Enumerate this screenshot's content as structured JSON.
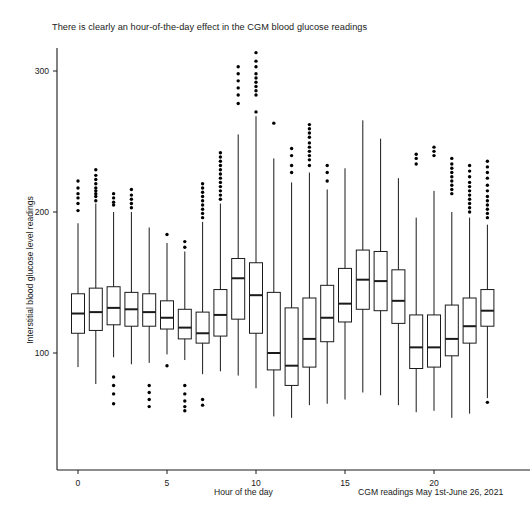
{
  "chart_data": {
    "type": "boxplot",
    "title": "There is clearly an hour-of-the-day effect in the CGM blood glucose readings",
    "xlabel": "Hour of the day",
    "ylabel": "Interstitial blood glucose level readings",
    "caption": "CGM readings May 1st-June 26, 2021",
    "grid": false,
    "legend": null,
    "xlim": [
      -0.8,
      23.8
    ],
    "ylim": [
      40,
      325
    ],
    "xticks": [
      0,
      5,
      10,
      15,
      20
    ],
    "yticks": [
      100,
      200,
      300
    ],
    "categories": [
      0,
      1,
      2,
      3,
      4,
      5,
      6,
      7,
      8,
      9,
      10,
      11,
      12,
      13,
      14,
      15,
      16,
      17,
      18,
      19,
      20,
      21,
      22,
      23
    ],
    "boxes": [
      {
        "hour": 0,
        "whisker_low": 90,
        "q1": 114,
        "median": 128,
        "q3": 142,
        "whisker_high": 192,
        "outliers": [
          201,
          206,
          210,
          213,
          217,
          222
        ]
      },
      {
        "hour": 1,
        "whisker_low": 78,
        "q1": 116,
        "median": 129,
        "q3": 146,
        "whisker_high": 206,
        "outliers": [
          208,
          211,
          213,
          215,
          217,
          220,
          223,
          226,
          230
        ]
      },
      {
        "hour": 2,
        "whisker_low": 97,
        "q1": 120,
        "median": 132,
        "q3": 147,
        "whisker_high": 200,
        "outliers": [
          205,
          207,
          210,
          213,
          83,
          77,
          71,
          64
        ]
      },
      {
        "hour": 3,
        "whisker_low": 92,
        "q1": 119,
        "median": 131,
        "q3": 143,
        "whisker_high": 200,
        "outliers": [
          203,
          206,
          209,
          212,
          216
        ]
      },
      {
        "hour": 4,
        "whisker_low": 93,
        "q1": 119,
        "median": 129,
        "q3": 142,
        "whisker_high": 189,
        "outliers": [
          77,
          72,
          67,
          62
        ]
      },
      {
        "hour": 5,
        "whisker_low": 99,
        "q1": 117,
        "median": 125,
        "q3": 137,
        "whisker_high": 178,
        "outliers": [
          184,
          91
        ]
      },
      {
        "hour": 6,
        "whisker_low": 95,
        "q1": 110,
        "median": 118,
        "q3": 131,
        "whisker_high": 172,
        "outliers": [
          175,
          179,
          77,
          71,
          66,
          62,
          59
        ]
      },
      {
        "hour": 7,
        "whisker_low": 85,
        "q1": 107,
        "median": 114,
        "q3": 129,
        "whisker_high": 193,
        "outliers": [
          196,
          199,
          202,
          205,
          208,
          211,
          214,
          217,
          220,
          67,
          63
        ]
      },
      {
        "hour": 8,
        "whisker_low": 87,
        "q1": 112,
        "median": 127,
        "q3": 145,
        "whisker_high": 206,
        "outliers": [
          209,
          212,
          215,
          218,
          221,
          224,
          227,
          230,
          233,
          236,
          239,
          242
        ]
      },
      {
        "hour": 9,
        "whisker_low": 84,
        "q1": 124,
        "median": 153,
        "q3": 167,
        "whisker_high": 255,
        "outliers": [
          277,
          283,
          288,
          293,
          298,
          303
        ]
      },
      {
        "hour": 10,
        "whisker_low": 75,
        "q1": 114,
        "median": 141,
        "q3": 164,
        "whisker_high": 268,
        "outliers": [
          271,
          283,
          286,
          289,
          292,
          295,
          298,
          303,
          307,
          313
        ]
      },
      {
        "hour": 11,
        "whisker_low": 55,
        "q1": 88,
        "median": 100,
        "q3": 143,
        "whisker_high": 238,
        "outliers": [
          263
        ]
      },
      {
        "hour": 12,
        "whisker_low": 54,
        "q1": 77,
        "median": 91,
        "q3": 132,
        "whisker_high": 221,
        "outliers": [
          228,
          233,
          240,
          245
        ]
      },
      {
        "hour": 13,
        "whisker_low": 63,
        "q1": 90,
        "median": 110,
        "q3": 139,
        "whisker_high": 228,
        "outliers": [
          233,
          237,
          240,
          243,
          246,
          249,
          253,
          256,
          259,
          262
        ]
      },
      {
        "hour": 14,
        "whisker_low": 64,
        "q1": 108,
        "median": 125,
        "q3": 148,
        "whisker_high": 216,
        "outliers": [
          222,
          228,
          233
        ]
      },
      {
        "hour": 15,
        "whisker_low": 67,
        "q1": 122,
        "median": 135,
        "q3": 160,
        "whisker_high": 231,
        "outliers": []
      },
      {
        "hour": 16,
        "whisker_low": 72,
        "q1": 131,
        "median": 152,
        "q3": 173,
        "whisker_high": 265,
        "outliers": []
      },
      {
        "hour": 17,
        "whisker_low": 70,
        "q1": 130,
        "median": 151,
        "q3": 172,
        "whisker_high": 252,
        "outliers": []
      },
      {
        "hour": 18,
        "whisker_low": 63,
        "q1": 121,
        "median": 137,
        "q3": 159,
        "whisker_high": 224,
        "outliers": []
      },
      {
        "hour": 19,
        "whisker_low": 58,
        "q1": 89,
        "median": 104,
        "q3": 127,
        "whisker_high": 196,
        "outliers": [
          234,
          238,
          241
        ]
      },
      {
        "hour": 20,
        "whisker_low": 59,
        "q1": 90,
        "median": 104,
        "q3": 127,
        "whisker_high": 215,
        "outliers": [
          240,
          243,
          246
        ]
      },
      {
        "hour": 21,
        "whisker_low": 54,
        "q1": 98,
        "median": 110,
        "q3": 134,
        "whisker_high": 200,
        "outliers": [
          213,
          216,
          219,
          222,
          225,
          228,
          231,
          234,
          238
        ]
      },
      {
        "hour": 22,
        "whisker_low": 57,
        "q1": 107,
        "median": 119,
        "q3": 139,
        "whisker_high": 196,
        "outliers": [
          200,
          203,
          206,
          209,
          212,
          215,
          218,
          221,
          225,
          229,
          233
        ]
      },
      {
        "hour": 23,
        "whisker_low": 68,
        "q1": 119,
        "median": 130,
        "q3": 145,
        "whisker_high": 191,
        "outliers": [
          196,
          199,
          202,
          205,
          208,
          211,
          215,
          219,
          224,
          228,
          232,
          236,
          65
        ]
      }
    ]
  },
  "axes": {
    "yticks": [
      "100",
      "200",
      "300"
    ],
    "xticks": [
      "0",
      "5",
      "10",
      "15",
      "20"
    ]
  },
  "colors": {
    "stroke": "#1a1a1a",
    "background": "#ffffff",
    "outlier": "#000000"
  }
}
